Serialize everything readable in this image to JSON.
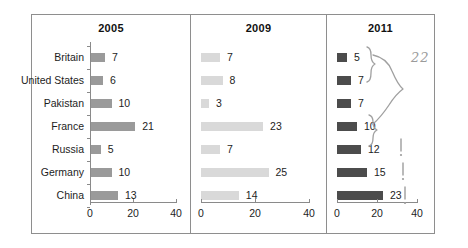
{
  "chart_data": {
    "type": "bar",
    "title": "",
    "xlabel": "",
    "ylabel": "",
    "xlim": [
      0,
      40
    ],
    "grid": false,
    "legend_position": "none",
    "orientation": "horizontal",
    "categories": [
      "Britain",
      "United States",
      "Pakistan",
      "France",
      "Russia",
      "Germany",
      "China"
    ],
    "xticks": [
      "0",
      "20",
      "40"
    ],
    "xtick_values": [
      0,
      20,
      40
    ],
    "panels": [
      {
        "title": "2005",
        "bar_color": "#9a9a9a",
        "show_category_labels": true,
        "values": [
          7,
          6,
          10,
          21,
          5,
          10,
          13
        ]
      },
      {
        "title": "2009",
        "bar_color": "#d9d9d9",
        "show_category_labels": false,
        "values": [
          7,
          8,
          3,
          23,
          7,
          25,
          14
        ]
      },
      {
        "title": "2011",
        "bar_color": "#4c4c4c",
        "show_category_labels": false,
        "values": [
          5,
          7,
          7,
          10,
          12,
          15,
          23
        ]
      }
    ],
    "series": [
      {
        "name": "2005",
        "values": [
          7,
          6,
          10,
          21,
          5,
          10,
          13
        ]
      },
      {
        "name": "2009",
        "values": [
          7,
          8,
          3,
          23,
          7,
          25,
          14
        ]
      },
      {
        "name": "2011",
        "values": [
          5,
          7,
          7,
          10,
          12,
          15,
          23
        ]
      }
    ],
    "annotations": [
      {
        "kind": "brace",
        "text": "",
        "panel": "2011",
        "rows": [
          "Britain",
          "United States"
        ]
      },
      {
        "kind": "brace",
        "text": "",
        "panel": "2011",
        "rows": [
          "France"
        ]
      },
      {
        "kind": "brace",
        "text": "",
        "panel": "2011",
        "rows": [
          "Britain",
          "United States",
          "Pakistan",
          "France"
        ]
      },
      {
        "kind": "handwritten-number",
        "text": "22",
        "panel": "2011"
      },
      {
        "kind": "exclamation",
        "text": "!",
        "panel": "2011",
        "row": "Russia"
      },
      {
        "kind": "exclamation",
        "text": "!",
        "panel": "2011",
        "row": "Germany"
      },
      {
        "kind": "exclamation",
        "text": "!",
        "panel": "2011",
        "row": "China"
      }
    ]
  }
}
